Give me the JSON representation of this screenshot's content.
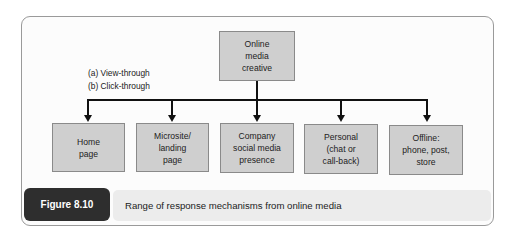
{
  "diagram": {
    "root": {
      "label": "Online\nmedia\ncreative"
    },
    "legend": {
      "text": "(a) View-through\n(b) Click-through"
    },
    "children": [
      {
        "label": "Home\npage"
      },
      {
        "label": "Microsite/\nlanding\npage"
      },
      {
        "label": "Company\nsocial media\npresence"
      },
      {
        "label": "Personal\n(chat or\ncall-back)"
      },
      {
        "label": "Offline:\nphone, post,\nstore"
      }
    ]
  },
  "figure": {
    "label": "Figure 8.10",
    "caption": "Range of response mechanisms from online media"
  },
  "colors": {
    "box_fill": "#cfcfcf",
    "line": "#111111",
    "label_bg": "#2e2e2e",
    "caption_bg": "#ececec"
  }
}
